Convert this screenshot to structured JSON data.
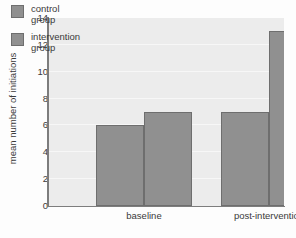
{
  "chart_data": {
    "type": "bar",
    "title": "",
    "xlabel": "",
    "ylabel": "mean number of initiations",
    "categories": [
      "baseline",
      "post-intervention"
    ],
    "series": [
      {
        "name": "control group",
        "values": [
          6,
          7
        ],
        "color": "#909090"
      },
      {
        "name": "intervention group",
        "values": [
          7,
          13
        ],
        "color": "#909090"
      }
    ],
    "ylim": [
      0,
      14
    ],
    "yticks": [
      0,
      2,
      4,
      6,
      8,
      10,
      12,
      14
    ],
    "ytick_labels": [
      "0",
      "2",
      "4",
      "6",
      "8",
      "10",
      "12",
      "14"
    ],
    "grid": true,
    "grid_color": "#f7f7f7",
    "legend_position": "upper left",
    "plot_background": "#ececec",
    "axis_color": "#7d7d7d",
    "bar_edge_color": "#6e6e6e",
    "text_color": "#3a3a3a"
  },
  "legend": {
    "entries": [
      {
        "line1": "control",
        "line2": "group"
      },
      {
        "line1": "intervention",
        "line2": "group"
      }
    ]
  }
}
